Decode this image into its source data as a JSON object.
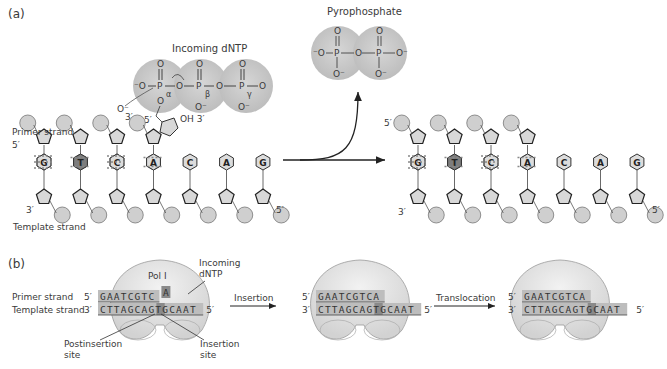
{
  "panel_a": {
    "label": "(a)",
    "incoming_dntp_label": "Incoming dNTP",
    "pyrophosphate_label": "Pyrophosphate",
    "primer_strand_label": "Primer strand",
    "template_strand_label": "Template strand",
    "phosphate_greek": [
      "α",
      "β",
      "γ"
    ],
    "atoms": {
      "P": "P",
      "O": "O",
      "O_minus": "O⁻",
      "minus_O": "⁻O",
      "oh3": "OH 3′"
    },
    "ends": {
      "five": "5′",
      "three": "3′"
    },
    "before": {
      "primer_bases": [
        "G",
        "T",
        "C",
        "A"
      ],
      "template_bases": [
        "C",
        "A",
        "G",
        "T",
        "C",
        "A",
        "G"
      ]
    },
    "after": {
      "primer_bases": [
        "G",
        "T",
        "C",
        "A"
      ],
      "template_bases": [
        "C",
        "A",
        "G",
        "T",
        "C",
        "A",
        "G"
      ]
    },
    "colors": {
      "circle": "#cfcfcf",
      "sugar": "#d8d8d8",
      "base_light": "#dcdcdc",
      "base_dark": "#7d7d7d",
      "dntp_cloud": "#c8c8c8"
    }
  },
  "panel_b": {
    "label": "(b)",
    "pol_label": "Pol I",
    "incoming_label_1": "Incoming",
    "incoming_label_2": "dNTP",
    "primer_strand_label": "Primer strand",
    "template_strand_label": "Template strand",
    "postinsertion_label_1": "Postinsertion",
    "postinsertion_label_2": "site",
    "insertion_label_1": "Insertion",
    "insertion_label_2": "site",
    "step1_label": "Insertion",
    "step2_label": "Translocation",
    "states": [
      {
        "primer": "GAATCGTC",
        "incoming": "A",
        "template": "CTTAGCAGTGCAAT"
      },
      {
        "primer": "GAATCGTCA",
        "template": "CTTAGCAGTGCAAT"
      },
      {
        "primer": "GAATCGTCA",
        "template": "CTTAGCAGTGCAAT"
      }
    ],
    "five_prime": "5′",
    "three_prime": "3′",
    "colors": {
      "enzyme": "#e4e4e4",
      "strand_bg": "#bdbdbd",
      "highlight": "#8a8a8a"
    }
  }
}
